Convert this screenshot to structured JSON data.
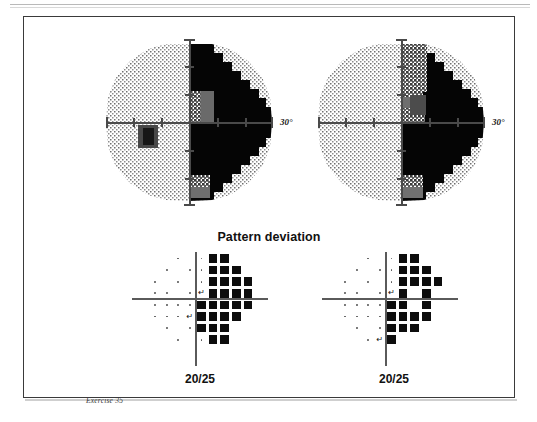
{
  "document": {
    "caption": "Exercise 35"
  },
  "section": {
    "pattern_deviation_title": "Pattern deviation"
  },
  "fields": [
    {
      "id": "left-eye",
      "side": "left",
      "axis_label": "30°",
      "acuity": "20/25",
      "blind_spot_marker": "↵",
      "grayscale": {
        "type": "humphrey-grayscale",
        "description": "dense black scotoma occupying the entire right hemifield",
        "dark_hemifield": "right",
        "blind_spot_position": "left-of-center-below-horizontal"
      },
      "pattern_deviation": {
        "rows": [
          [
            "",
            "",
            "",
            "dot",
            "",
            "dot",
            "square",
            "square",
            "",
            ""
          ],
          [
            "",
            "",
            "dot",
            "",
            "dot",
            "dot",
            "square",
            "square",
            "square",
            ""
          ],
          [
            "",
            "dot",
            "",
            "dot",
            "",
            "dot",
            "square",
            "square",
            "square",
            "square"
          ],
          [
            "",
            "dot",
            "dot",
            "",
            "dot",
            "blind",
            "square",
            "square",
            "square",
            "square"
          ],
          [
            "",
            "dot",
            "dot",
            "dot",
            "dot",
            "square",
            "square",
            "square",
            "square",
            "square"
          ],
          [
            "",
            "dot",
            "dot",
            "dot",
            "blind",
            "square",
            "square",
            "square",
            "square",
            ""
          ],
          [
            "",
            "",
            "dot",
            "",
            "dot",
            "square",
            "square",
            "square",
            "",
            ""
          ],
          [
            "",
            "",
            "",
            "dot",
            "",
            "dot",
            "square",
            "square",
            "",
            ""
          ]
        ]
      }
    },
    {
      "id": "right-eye",
      "side": "right",
      "axis_label": "30°",
      "acuity": "20/25",
      "blind_spot_marker": "↵",
      "grayscale": {
        "type": "humphrey-grayscale",
        "description": "dense black scotoma occupying the entire right hemifield",
        "dark_hemifield": "right",
        "blind_spot_position": "right-of-center-above-horizontal"
      },
      "pattern_deviation": {
        "rows": [
          [
            "",
            "",
            "",
            "dot",
            "",
            "dot",
            "square",
            "square",
            "",
            ""
          ],
          [
            "",
            "",
            "dot",
            "",
            "dot",
            "dot",
            "square",
            "square",
            "square",
            ""
          ],
          [
            "",
            "dot",
            "",
            "dot",
            "",
            "dot",
            "square",
            "square",
            "square",
            "square"
          ],
          [
            "",
            "dot",
            "dot",
            "",
            "dot",
            "blind",
            "square",
            "",
            "square",
            ""
          ],
          [
            "",
            "dot",
            "dot",
            "dot",
            "dot",
            "square",
            "square",
            "",
            "square",
            ""
          ],
          [
            "",
            "dot",
            "dot",
            "dot",
            "dot",
            "square",
            "square",
            "square",
            "square",
            ""
          ],
          [
            "",
            "",
            "dot",
            "",
            "dot",
            "square",
            "square",
            "square",
            "",
            ""
          ],
          [
            "",
            "",
            "",
            "dot",
            "blind",
            "square",
            "",
            "",
            "",
            ""
          ]
        ]
      }
    }
  ],
  "colors": {
    "ink": "#0d0d0d",
    "frame": "#3a3a3a",
    "axis": "#4a4a4a",
    "dot": "#555555",
    "paper": "#ffffff"
  }
}
